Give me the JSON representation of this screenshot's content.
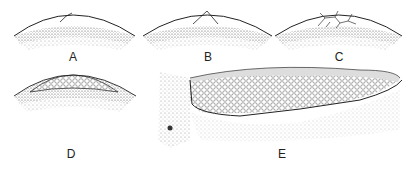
{
  "figure": {
    "panels": [
      {
        "id": "A",
        "label": "A",
        "description": "Dome with single short line (first cleavage furrow)"
      },
      {
        "id": "B",
        "label": "B",
        "description": "Dome with two crossing furrows"
      },
      {
        "id": "C",
        "label": "C",
        "description": "Dome with network of cell outlines"
      },
      {
        "id": "D",
        "label": "D",
        "description": "Dome covered by many small cells (blastodisc)"
      },
      {
        "id": "E",
        "label": "E",
        "description": "Section view of elongated cell mass with granular cells"
      }
    ]
  }
}
